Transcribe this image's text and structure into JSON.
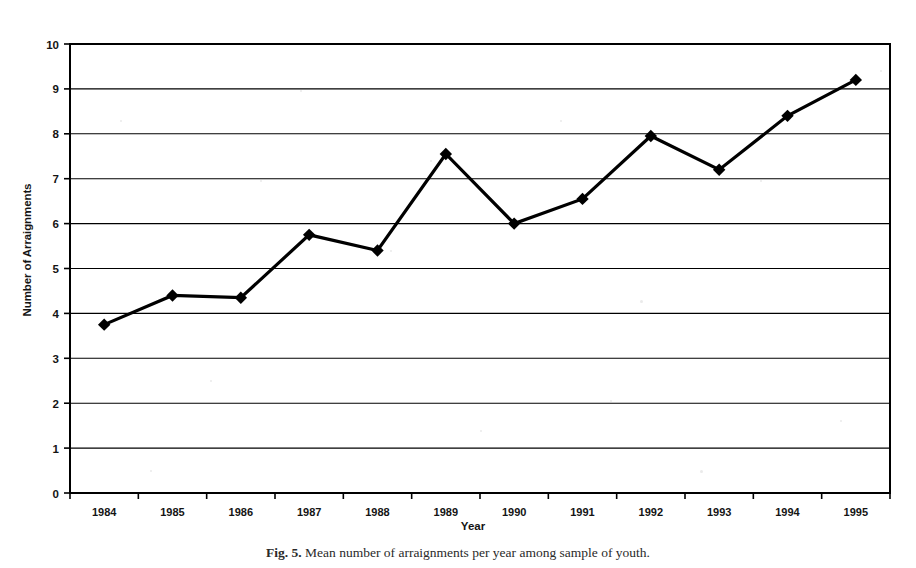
{
  "figure": {
    "caption_label": "Fig. 5.",
    "caption_text": "Mean number of arraignments per year among sample of youth."
  },
  "chart_data": {
    "type": "line",
    "title": "",
    "xlabel": "Year",
    "ylabel": "Number of Arraignments",
    "categories": [
      "1984",
      "1985",
      "1986",
      "1987",
      "1988",
      "1989",
      "1990",
      "1991",
      "1992",
      "1993",
      "1994",
      "1995"
    ],
    "values": [
      3.75,
      4.4,
      4.35,
      5.75,
      5.4,
      7.55,
      6.0,
      6.55,
      7.95,
      7.2,
      8.4,
      9.2
    ],
    "series": [
      {
        "name": "Mean arraignments",
        "values": [
          3.75,
          4.4,
          4.35,
          5.75,
          5.4,
          7.55,
          6.0,
          6.55,
          7.95,
          7.2,
          8.4,
          9.2
        ]
      }
    ],
    "ylim": [
      0,
      10
    ],
    "yticks": [
      0,
      1,
      2,
      3,
      4,
      5,
      6,
      7,
      8,
      9,
      10
    ],
    "ytick_labels": [
      "0",
      "1",
      "2",
      "3",
      "4",
      "5",
      "6",
      "7",
      "8",
      "9",
      "10"
    ],
    "grid": "horizontal",
    "legend": "none",
    "marker": "diamond",
    "marker_color": "#000000",
    "line_color": "#000000",
    "plot_background": "#ffffff",
    "frame_color": "#000000"
  }
}
